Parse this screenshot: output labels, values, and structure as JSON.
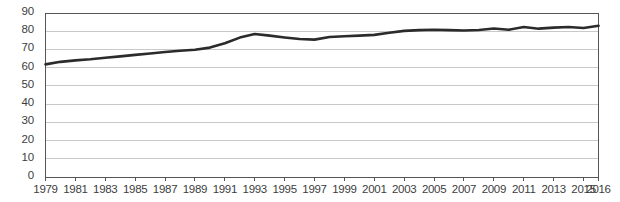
{
  "chart_data": {
    "type": "line",
    "title": "",
    "subtitle": "",
    "xlabel": "",
    "ylabel": "",
    "grid": true,
    "legend": null,
    "legend_position": "none",
    "line_color": "#2b2b2b",
    "grid_color": "#c9c9c9",
    "axis_color": "#555555",
    "text_color": "#3d3d3d",
    "ylim": [
      0,
      90
    ],
    "yticks": [
      0,
      10,
      20,
      30,
      40,
      50,
      60,
      70,
      80,
      90
    ],
    "ytick_labels": [
      "0",
      "10",
      "20",
      "30",
      "40",
      "50",
      "60",
      "70",
      "80",
      "90"
    ],
    "xlim": [
      1979,
      2016
    ],
    "xtick_labels": [
      "1979",
      "1981",
      "1983",
      "1985",
      "1987",
      "1989",
      "1991",
      "1993",
      "1995",
      "1997",
      "1999",
      "2001",
      "2003",
      "2005",
      "2007",
      "2009",
      "2011",
      "2013",
      "2015",
      "2016"
    ],
    "xticks": [
      1979,
      1981,
      1983,
      1985,
      1987,
      1989,
      1991,
      1993,
      1995,
      1997,
      1999,
      2001,
      2003,
      2005,
      2007,
      2009,
      2011,
      2013,
      2015,
      2016
    ],
    "x": [
      1979,
      1980,
      1981,
      1982,
      1983,
      1984,
      1985,
      1986,
      1987,
      1988,
      1989,
      1990,
      1991,
      1992,
      1993,
      1994,
      1995,
      1996,
      1997,
      1998,
      1999,
      2000,
      2001,
      2002,
      2003,
      2004,
      2005,
      2006,
      2007,
      2008,
      2009,
      2010,
      2011,
      2012,
      2013,
      2014,
      2015,
      2016
    ],
    "values": [
      61.8,
      63.2,
      64.0,
      64.6,
      65.4,
      66.2,
      67.0,
      67.8,
      68.6,
      69.3,
      69.8,
      71.0,
      73.4,
      76.5,
      78.5,
      77.6,
      76.6,
      75.7,
      75.4,
      76.8,
      77.2,
      77.6,
      78.0,
      79.2,
      80.2,
      80.6,
      80.8,
      80.6,
      80.4,
      80.7,
      81.5,
      80.8,
      82.3,
      81.4,
      82.0,
      82.3,
      81.8,
      83.0
    ]
  }
}
